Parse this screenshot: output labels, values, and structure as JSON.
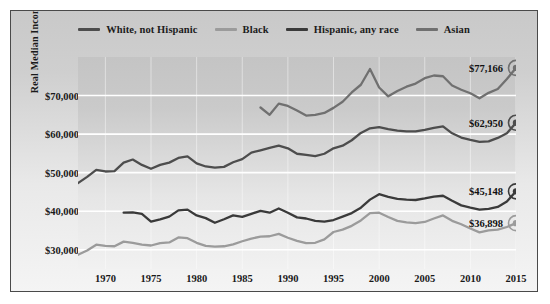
{
  "figure": {
    "y_axis_title": "Real Median Income"
  },
  "legend": {
    "position": "top-center",
    "items": [
      {
        "label": "White, not Hispanic",
        "color": "#4d4d4d"
      },
      {
        "label": "Black",
        "color": "#9b9b9b"
      },
      {
        "label": "Hispanic, any race",
        "color": "#3a3a3a"
      },
      {
        "label": "Asian",
        "color": "#707070"
      }
    ]
  },
  "end_labels": [
    {
      "name": "asian-end-label",
      "text": "$77,166",
      "value": 77166,
      "year": 2015,
      "color": "#707070"
    },
    {
      "name": "white-end-label",
      "text": "$62,950",
      "value": 62950,
      "year": 2015,
      "color": "#4d4d4d"
    },
    {
      "name": "hispanic-end-label",
      "text": "$45,148",
      "value": 45148,
      "year": 2015,
      "color": "#3a3a3a"
    },
    {
      "name": "black-end-label",
      "text": "$36,898",
      "value": 36898,
      "year": 2015,
      "color": "#9b9b9b"
    }
  ],
  "chart_data": {
    "type": "line",
    "title": "",
    "xlabel": "",
    "ylabel": "Real Median Income",
    "xlim": [
      1967,
      2015
    ],
    "ylim": [
      25000,
      80000
    ],
    "xticks": [
      1970,
      1975,
      1980,
      1985,
      1990,
      1995,
      2000,
      2005,
      2010,
      2015
    ],
    "xtick_labels": [
      "1970",
      "1975",
      "1980",
      "1985",
      "1990",
      "1995",
      "2000",
      "2005",
      "2010",
      "2015"
    ],
    "yticks": [
      30000,
      40000,
      50000,
      60000,
      70000
    ],
    "ytick_labels": [
      "$30,000",
      "$40,000",
      "$50,000",
      "$60,000",
      "$70,000"
    ],
    "grid": "horizontal",
    "legend_position": "top-center",
    "series": [
      {
        "name": "White, not Hispanic",
        "color": "#4d4d4d",
        "end_value": 62950,
        "x": [
          1967,
          1968,
          1969,
          1970,
          1971,
          1972,
          1973,
          1974,
          1975,
          1976,
          1977,
          1978,
          1979,
          1980,
          1981,
          1982,
          1983,
          1984,
          1985,
          1986,
          1987,
          1988,
          1989,
          1990,
          1991,
          1992,
          1993,
          1994,
          1995,
          1996,
          1997,
          1998,
          1999,
          2000,
          2001,
          2002,
          2003,
          2004,
          2005,
          2006,
          2007,
          2008,
          2009,
          2010,
          2011,
          2012,
          2013,
          2014,
          2015
        ],
        "values": [
          47300,
          48900,
          50700,
          50300,
          50400,
          52600,
          53400,
          52000,
          51000,
          52000,
          52600,
          53800,
          54200,
          52400,
          51600,
          51300,
          51500,
          52700,
          53500,
          55200,
          55800,
          56400,
          57000,
          56300,
          54900,
          54600,
          54300,
          54900,
          56300,
          57000,
          58400,
          60300,
          61500,
          61800,
          61300,
          60900,
          60700,
          60700,
          61100,
          61600,
          62000,
          60200,
          59100,
          58500,
          58000,
          58100,
          59000,
          60200,
          62950
        ]
      },
      {
        "name": "Black",
        "color": "#9b9b9b",
        "end_value": 36898,
        "x": [
          1967,
          1968,
          1969,
          1970,
          1971,
          1972,
          1973,
          1974,
          1975,
          1976,
          1977,
          1978,
          1979,
          1980,
          1981,
          1982,
          1983,
          1984,
          1985,
          1986,
          1987,
          1988,
          1989,
          1990,
          1991,
          1992,
          1993,
          1994,
          1995,
          1996,
          1997,
          1998,
          1999,
          2000,
          2001,
          2002,
          2003,
          2004,
          2005,
          2006,
          2007,
          2008,
          2009,
          2010,
          2011,
          2012,
          2013,
          2014,
          2015
        ],
        "values": [
          28700,
          29800,
          31300,
          31000,
          30900,
          32100,
          31800,
          31300,
          31100,
          31700,
          31900,
          33200,
          33000,
          31800,
          31000,
          30800,
          30900,
          31400,
          32200,
          32900,
          33400,
          33500,
          34100,
          33100,
          32300,
          31700,
          31800,
          32700,
          34600,
          35200,
          36200,
          37600,
          39500,
          39600,
          38500,
          37500,
          37100,
          36900,
          37200,
          38100,
          38900,
          37500,
          36600,
          35500,
          34500,
          35000,
          35200,
          35900,
          36898
        ]
      },
      {
        "name": "Hispanic, any race",
        "color": "#3a3a3a",
        "end_value": 45148,
        "x": [
          1972,
          1973,
          1974,
          1975,
          1976,
          1977,
          1978,
          1979,
          1980,
          1981,
          1982,
          1983,
          1984,
          1985,
          1986,
          1987,
          1988,
          1989,
          1990,
          1991,
          1992,
          1993,
          1994,
          1995,
          1996,
          1997,
          1998,
          1999,
          2000,
          2001,
          2002,
          2003,
          2004,
          2005,
          2006,
          2007,
          2008,
          2009,
          2010,
          2011,
          2012,
          2013,
          2014,
          2015
        ],
        "values": [
          39600,
          39700,
          39300,
          37300,
          37900,
          38600,
          40200,
          40400,
          38900,
          38200,
          37000,
          37900,
          38900,
          38500,
          39300,
          40100,
          39600,
          40700,
          39600,
          38400,
          38100,
          37500,
          37300,
          37700,
          38600,
          39500,
          40900,
          43000,
          44400,
          43700,
          43200,
          43000,
          42900,
          43300,
          43800,
          44000,
          42700,
          41500,
          40900,
          40400,
          40600,
          41100,
          42500,
          45148
        ]
      },
      {
        "name": "Asian",
        "color": "#707070",
        "end_value": 77166,
        "x": [
          1987,
          1988,
          1989,
          1990,
          1991,
          1992,
          1993,
          1994,
          1995,
          1996,
          1997,
          1998,
          1999,
          2000,
          2001,
          2002,
          2003,
          2004,
          2005,
          2006,
          2007,
          2008,
          2009,
          2010,
          2011,
          2012,
          2013,
          2014,
          2015
        ],
        "values": [
          66900,
          65000,
          67900,
          67300,
          66100,
          64800,
          65000,
          65500,
          66800,
          68400,
          70800,
          72800,
          76900,
          72100,
          69800,
          71200,
          72300,
          73100,
          74500,
          75200,
          75000,
          72600,
          71500,
          70600,
          69300,
          70700,
          71700,
          74300,
          77166
        ]
      }
    ]
  }
}
